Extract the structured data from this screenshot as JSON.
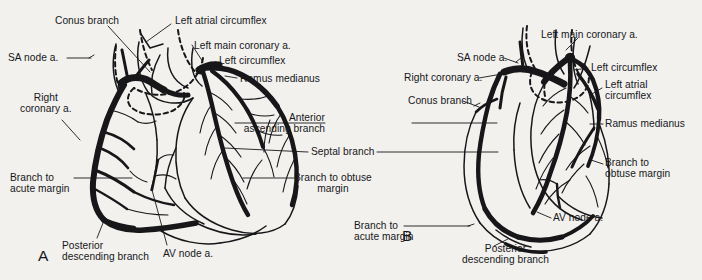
{
  "figure": {
    "type": "anatomical-illustration",
    "background_color": "#f2f1ee",
    "ink_color": "#17171a"
  },
  "panels": [
    {
      "id": "A",
      "letter": "A",
      "letter_pos": {
        "x": 38,
        "y": 248
      },
      "labels": [
        {
          "name": "conus-branch",
          "text": "Conus branch",
          "x": 55,
          "y": 15,
          "align": "left"
        },
        {
          "name": "left-atrial-circumflex",
          "text": "Left atrial circumflex",
          "x": 175,
          "y": 15,
          "align": "left"
        },
        {
          "name": "sa-node-a",
          "text": "SA node a.",
          "x": 8,
          "y": 52,
          "align": "left"
        },
        {
          "name": "left-main-coronary-a",
          "text": "Left main coronary a.",
          "x": 194,
          "y": 40,
          "align": "left"
        },
        {
          "name": "left-circumflex",
          "text": "Left circumflex",
          "x": 219,
          "y": 55,
          "align": "left"
        },
        {
          "name": "ramus-medianus",
          "text": "Ramus medianus",
          "x": 240,
          "y": 73,
          "align": "left"
        },
        {
          "name": "right-coronary-a",
          "text": "Right\ncoronary a.",
          "x": 20,
          "y": 92,
          "align": "left"
        },
        {
          "name": "branch-to-acute-margin",
          "text": "Branch to\nacute margin",
          "x": 10,
          "y": 172,
          "align": "left"
        },
        {
          "name": "posterior-descending-branch",
          "text": "Posterior\ndescending branch",
          "x": 62,
          "y": 240,
          "align": "left"
        },
        {
          "name": "av-node-a",
          "text": "AV node a.",
          "x": 163,
          "y": 248,
          "align": "left"
        }
      ]
    },
    {
      "id": "center",
      "letter": "",
      "labels": [
        {
          "name": "anterior-ascending-branch",
          "text": "Anterior\nascending branch",
          "x": 330,
          "y": 112,
          "align": "left"
        },
        {
          "name": "septal-branch",
          "text": "Septal branch",
          "x": 311,
          "y": 148,
          "align": "left"
        },
        {
          "name": "branch-to-obtuse-margin-a",
          "text": "Branch to obtuse\nmargin",
          "x": 297,
          "y": 172,
          "align": "left"
        }
      ]
    },
    {
      "id": "B",
      "letter": "B",
      "letter_pos": {
        "x": 402,
        "y": 228
      },
      "labels": [
        {
          "name": "left-main-coronary-a",
          "text": "Left main coronary a.",
          "x": 541,
          "y": 29,
          "align": "left"
        },
        {
          "name": "sa-node-a",
          "text": "SA node a.",
          "x": 457,
          "y": 52,
          "align": "left"
        },
        {
          "name": "right-coronary-a",
          "text": "Right coronary a.",
          "x": 404,
          "y": 72,
          "align": "left"
        },
        {
          "name": "left-circumflex",
          "text": "Left circumflex",
          "x": 591,
          "y": 62,
          "align": "left"
        },
        {
          "name": "conus-branch",
          "text": "Conus branch",
          "x": 408,
          "y": 95,
          "align": "left"
        },
        {
          "name": "left-atrial-circumflex",
          "text": "Left atrial\ncircumflex",
          "x": 605,
          "y": 81,
          "align": "left"
        },
        {
          "name": "ramus-medianus",
          "text": "Ramus medianus",
          "x": 605,
          "y": 119,
          "align": "left"
        },
        {
          "name": "branch-to-obtuse-margin",
          "text": "Branch to\nobtuse margin",
          "x": 605,
          "y": 158,
          "align": "left"
        },
        {
          "name": "av-node-a",
          "text": "AV node a.",
          "x": 553,
          "y": 213,
          "align": "left"
        },
        {
          "name": "branch-to-acute-margin",
          "text": "Branch to\nacute margin",
          "x": 354,
          "y": 220,
          "align": "left"
        },
        {
          "name": "posterior-descending-branch",
          "text": "Posterior\ndescending branch",
          "x": 462,
          "y": 243,
          "align": "left"
        }
      ]
    }
  ],
  "all_label_texts": [
    "Conus branch",
    "Left atrial circumflex",
    "SA node a.",
    "Left main coronary a.",
    "Left circumflex",
    "Ramus medianus",
    "Right coronary a.",
    "Branch to acute margin",
    "Posterior descending branch",
    "AV node a.",
    "Anterior ascending branch",
    "Septal branch",
    "Branch to obtuse margin",
    "Left atrial circumflex"
  ]
}
